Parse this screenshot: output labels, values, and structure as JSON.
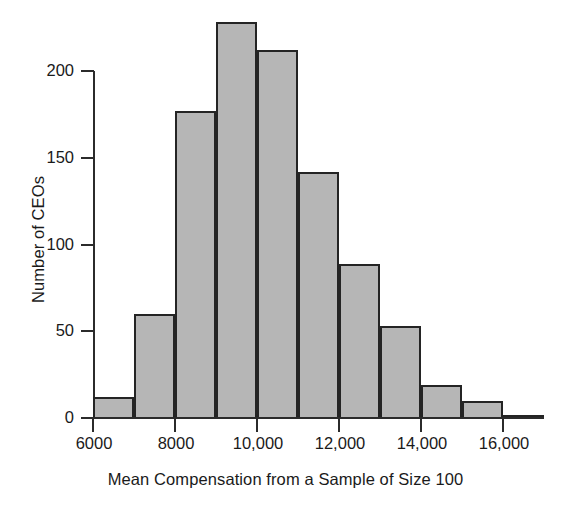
{
  "chart_data": {
    "type": "bar",
    "title": "",
    "subtitle": "",
    "xlabel": "Mean Compensation from a Sample of Size 100",
    "ylabel": "Number of CEOs",
    "grid": false,
    "legend": "none",
    "xlim": [
      6000,
      17000
    ],
    "ylim": [
      0,
      200
    ],
    "bin_width": 1000,
    "x_tick_labels": [
      "6000",
      "8000",
      "10,000",
      "12,000",
      "14,000",
      "16,000"
    ],
    "x_tick_values": [
      6000,
      8000,
      10000,
      12000,
      14000,
      16000
    ],
    "y_tick_labels": [
      "0",
      "50",
      "100",
      "150",
      "200"
    ],
    "y_tick_values": [
      0,
      50,
      100,
      150,
      200
    ],
    "categories": [
      "6000-7000",
      "7000-8000",
      "8000-9000",
      "9000-10,000",
      "10,000-11,000",
      "11,000-12,000",
      "12,000-13,000",
      "13,000-14,000",
      "14,000-15,000",
      "15,000-16,000",
      "16,000-17,000"
    ],
    "bin_edges": [
      6000,
      7000,
      8000,
      9000,
      10000,
      11000,
      12000,
      13000,
      14000,
      15000,
      16000,
      17000
    ],
    "values": [
      12,
      60,
      177,
      228,
      212,
      142,
      89,
      53,
      19,
      10,
      1
    ],
    "bar_fill_color": "#b6b6b6",
    "bar_edge_color": "#242424",
    "axis_color": "#2b2b2b",
    "background_color": "#ffffff"
  },
  "axes": {
    "y_label": "Number of CEOs",
    "x_label": "Mean Compensation from a Sample of Size 100"
  }
}
